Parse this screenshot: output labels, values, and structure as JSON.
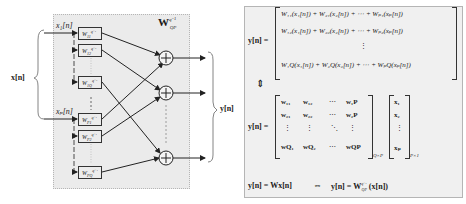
{
  "diagram": {
    "left": {
      "title": "W",
      "title_sup": "q⁻¹",
      "title_sub": "QP",
      "input_vector_label": "x[n]",
      "output_vector_label": "y[n]",
      "inputs": [
        {
          "label": "x₁[n]"
        },
        {
          "label": "xₚ[n]"
        }
      ],
      "filters": [
        {
          "label": "W",
          "sub": "11"
        },
        {
          "label": "W",
          "sub": "12"
        },
        {
          "label": "W",
          "sub": "1Q"
        },
        {
          "label": "W",
          "sub": "P1"
        },
        {
          "label": "W",
          "sub": "P2"
        },
        {
          "label": "W",
          "sub": "PQ"
        }
      ],
      "filter_sup": "q⁻¹",
      "summer_symbol": "+"
    },
    "right": {
      "eq1_lhs": "y[n] =",
      "eq1_rows": [
        "W₁₁(x₁[n]) + W₂₁(x₂[n]) + ⋯ + Wₚ₁(xₚ[n])",
        "W₁₂(x₁[n]) + W₂₂(x₂[n]) + ⋯ + Wₚ₂(xₚ[n])",
        "⋮",
        "W₁Q(x₁[n]) + W₂Q(x₂[n]) + ⋯ + WₚQ(xₚ[n])"
      ],
      "equiv_symbol": "⇕",
      "eq2_lhs": "y[n] =",
      "matrix_w": [
        [
          "w₁₁",
          "w₁₂",
          "⋯",
          "w₁P"
        ],
        [
          "w₂₁",
          "w₂₂",
          "⋯",
          "w₂P"
        ],
        [
          "⋮",
          "⋮",
          "⋱",
          "⋮"
        ],
        [
          "wQ₁",
          "wQ₂",
          "⋯",
          "wQP"
        ]
      ],
      "matrix_w_sup": "H",
      "matrix_w_size": "Q×P",
      "vector_x": [
        "x₁",
        "x₂",
        "⋮",
        "xₚ"
      ],
      "vector_x_size": "P×1",
      "eq3_left": "y[n] = Wx[n]",
      "eq3_arrow": "⇔",
      "eq3_right_pre": "y[n] = W",
      "eq3_right_sup": "q⁻¹",
      "eq3_right_sub": "QP",
      "eq3_right_post": "(x[n])"
    }
  }
}
